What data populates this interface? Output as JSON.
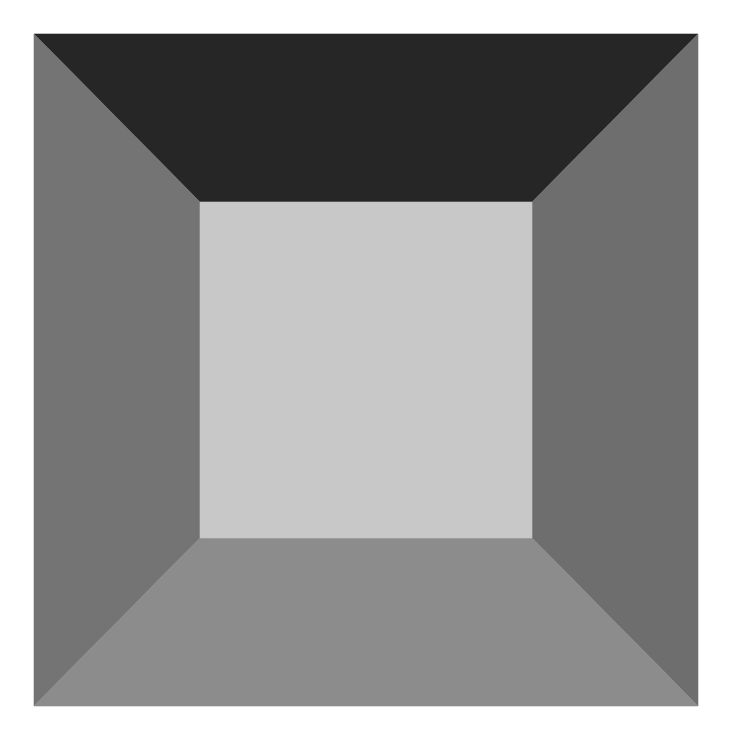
{
  "figure": {
    "canvas": {
      "width": 736,
      "height": 741,
      "background": "#ffffff"
    },
    "outer_square": {
      "x1": 34,
      "y1": 34,
      "x2": 698,
      "y2": 706
    },
    "inner_square": {
      "x1": 200,
      "y1": 202,
      "x2": 532,
      "y2": 538
    },
    "faces": {
      "top": {
        "color": "#262626"
      },
      "left": {
        "color": "#747474"
      },
      "right": {
        "color": "#6e6e6e"
      },
      "bottom": {
        "color": "#8c8c8c"
      },
      "center": {
        "color": "#c8c8c8"
      }
    }
  }
}
